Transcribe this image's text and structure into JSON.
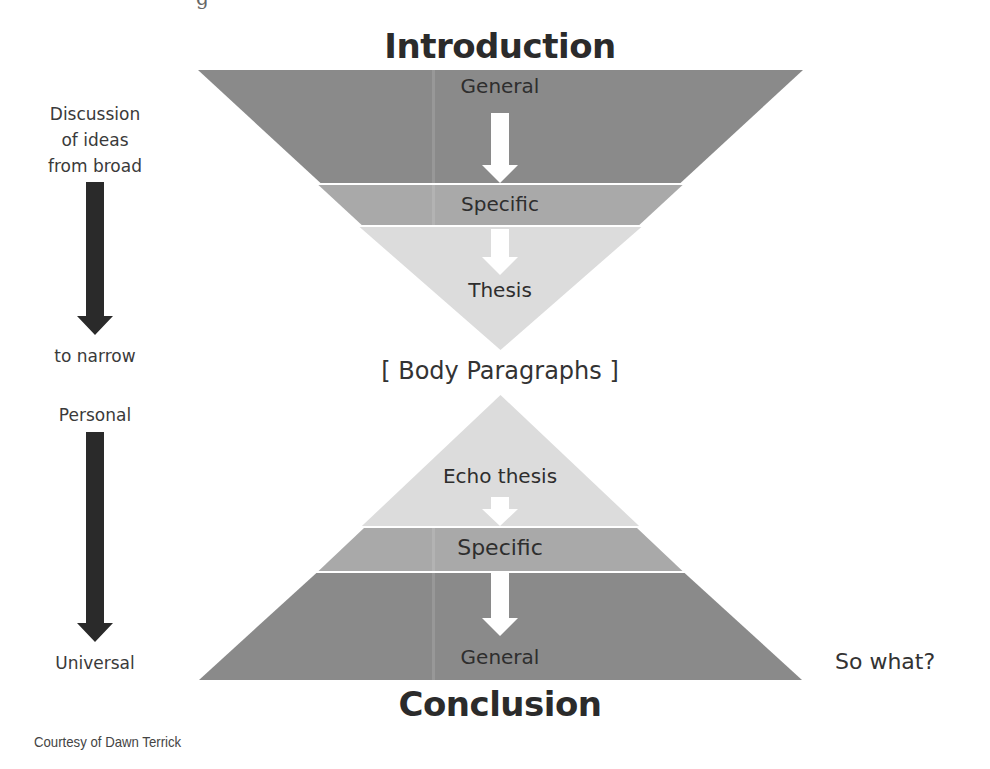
{
  "diagram": {
    "top_fragment": "g",
    "introduction": {
      "title": "Introduction",
      "bands": [
        {
          "label": "General",
          "color": "#8a8a8a"
        },
        {
          "label": "Specific",
          "color": "#a9a9a9"
        },
        {
          "label": "Thesis",
          "color": "#dcdcdc"
        }
      ]
    },
    "body": {
      "label": "[ Body Paragraphs ]"
    },
    "conclusion": {
      "title": "Conclusion",
      "bands": [
        {
          "label": "Echo thesis",
          "color": "#dcdcdc"
        },
        {
          "label": "Specific",
          "color": "#a9a9a9"
        },
        {
          "label": "General",
          "color": "#8a8a8a"
        }
      ]
    },
    "left_annotations": {
      "top_start": [
        "Discussion",
        "of ideas",
        "from broad"
      ],
      "top_end": "to narrow",
      "bottom_start": "Personal",
      "bottom_end": "Universal"
    },
    "right_annotation": "So what?",
    "credit": "Courtesy of Dawn Terrick",
    "colors": {
      "dark_band": "#8a8a8a",
      "medium_band": "#a9a9a9",
      "light_band": "#dcdcdc",
      "side_arrow": "#2a2a2a",
      "inner_arrow": "#ffffff"
    }
  }
}
